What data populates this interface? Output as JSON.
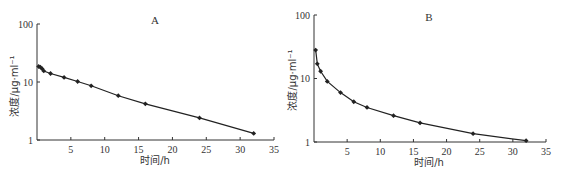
{
  "chart_data": [
    {
      "type": "line",
      "panel": "A",
      "title": "A",
      "xlabel": "时间/h",
      "ylabel": "浓度/μg·ml⁻¹",
      "yscale": "log",
      "xlim": [
        0,
        35
      ],
      "ylim": [
        1,
        100
      ],
      "xticks": [
        5,
        10,
        15,
        20,
        25,
        30,
        35
      ],
      "yticks": [
        1,
        10,
        100
      ],
      "grid": false,
      "marker": "diamond",
      "x": [
        0.25,
        0.5,
        0.75,
        1,
        2,
        4,
        6,
        8,
        12,
        16,
        24,
        32
      ],
      "values": [
        18.5,
        18,
        17,
        15.5,
        14,
        12,
        10.2,
        8.6,
        5.8,
        4.2,
        2.4,
        1.3
      ]
    },
    {
      "type": "line",
      "panel": "B",
      "title": "B",
      "xlabel": "时间/h",
      "ylabel": "浓度/μg·ml⁻¹",
      "yscale": "log",
      "xlim": [
        0,
        35
      ],
      "ylim": [
        1,
        100
      ],
      "xticks": [
        5,
        10,
        15,
        20,
        25,
        30,
        35
      ],
      "yticks": [
        1,
        10,
        100
      ],
      "grid": false,
      "marker": "diamond",
      "x": [
        0.25,
        0.5,
        1,
        2,
        4,
        6,
        8,
        12,
        16,
        24,
        32
      ],
      "values": [
        28,
        17,
        13,
        9,
        6,
        4.3,
        3.5,
        2.6,
        2.0,
        1.35,
        1.05
      ]
    }
  ],
  "panels": [
    {
      "label": "A",
      "xlabel": "时间/h",
      "ylabel": "浓度/μg·ml⁻¹",
      "xtick_labels": [
        "5",
        "10",
        "15",
        "20",
        "25",
        "30",
        "35"
      ],
      "ytick_labels": [
        "1",
        "10",
        "100"
      ]
    },
    {
      "label": "B",
      "xlabel": "时间/h",
      "ylabel": "浓度/μg·ml⁻¹",
      "xtick_labels": [
        "5",
        "10",
        "15",
        "20",
        "25",
        "30",
        "35"
      ],
      "ytick_labels": [
        "1",
        "10",
        "100"
      ]
    }
  ],
  "colors": {
    "line": "#222222",
    "axis": "#333333",
    "background": "#ffffff"
  }
}
